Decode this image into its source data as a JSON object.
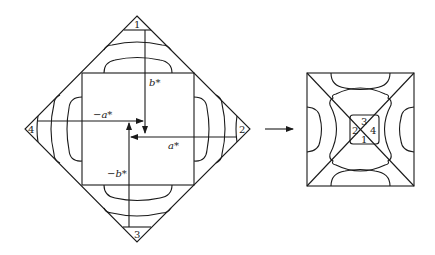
{
  "diagram": {
    "left_figure": {
      "corner_labels": {
        "top": "1",
        "right": "2",
        "bottom": "3",
        "left": "4"
      },
      "axis_labels": {
        "b_star": "b*",
        "neg_a_star": "−a*",
        "a_star": "a*",
        "neg_b_star": "−b*"
      }
    },
    "transition_arrow": "right-arrow",
    "right_figure": {
      "center_labels": {
        "top": "3",
        "left": "2",
        "right": "4",
        "bottom": "1"
      }
    },
    "colors": {
      "line": "#1a1a1a",
      "background": "#ffffff"
    }
  }
}
